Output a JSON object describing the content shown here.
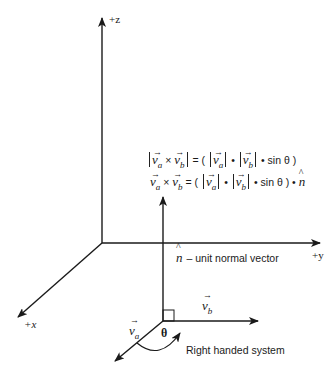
{
  "axes": {
    "z_label": "+z",
    "y_label": "+y",
    "x_label": "+x"
  },
  "formulas": {
    "magnitude": {
      "lhs_open": "|",
      "va": "v",
      "va_sub": "a",
      "cross": "×",
      "vb": "v",
      "vb_sub": "b",
      "lhs_close": "|",
      "equals": "=",
      "open_paren": "(",
      "dot1": "•",
      "dot2": "•",
      "sin_theta": "sin θ",
      "close_paren": ")"
    },
    "vector": {
      "va": "v",
      "va_sub": "a",
      "cross": "×",
      "vb": "v",
      "vb_sub": "b",
      "equals": "=",
      "open_paren": "(",
      "dot1": "•",
      "dot2": "•",
      "sin_theta": "sin θ",
      "close_paren": ")",
      "dot3": "•",
      "n": "n"
    }
  },
  "labels": {
    "normal_symbol": "n",
    "normal_text": "– unit normal vector",
    "vb_symbol": "v",
    "vb_sub": "b",
    "va_symbol": "v",
    "va_sub": "a",
    "theta": "θ",
    "rotation": "Right handed system",
    "arrow_glyph": "→",
    "hat_glyph": "^"
  },
  "colors": {
    "stroke": "#1a1a1a",
    "background": "#ffffff"
  }
}
